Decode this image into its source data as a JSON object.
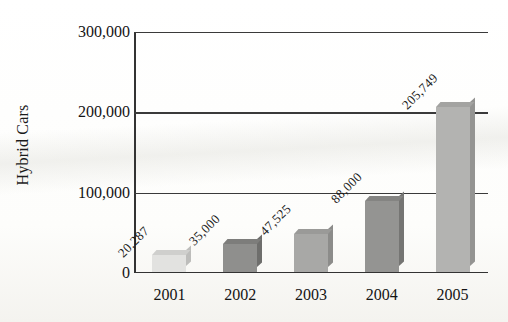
{
  "chart_data": {
    "type": "bar",
    "title": "",
    "xlabel": "",
    "ylabel": "Hybrid Cars",
    "categories": [
      "2001",
      "2002",
      "2003",
      "2004",
      "2005"
    ],
    "values": [
      20287,
      35000,
      47525,
      88000,
      205749
    ],
    "value_labels": [
      "20,287",
      "35,000",
      "47,525",
      "88,000",
      "205,749"
    ],
    "ylim": [
      0,
      300000
    ],
    "ytick_values": [
      0,
      100000,
      200000,
      300000
    ],
    "ytick_labels": [
      "0",
      "100,000",
      "200,000",
      "300,000"
    ],
    "grid": true,
    "grid_axis": "y",
    "legend": false,
    "bar_colors": [
      "#e2e2e0",
      "#8f8f8d",
      "#a8a8a6",
      "#949492",
      "#b3b3b1"
    ],
    "bar_top_colors": [
      "#cfcfcd",
      "#7d7d7b",
      "#9a9a98",
      "#848482",
      "#a3a3a1"
    ],
    "bar_side_colors": [
      "#bdbdbb",
      "#6e6e6c",
      "#8c8c8a",
      "#757573",
      "#949492"
    ],
    "axis_color": "#333333",
    "grid_color": "#3a3a3a",
    "background": "#fdfdfb",
    "value_label_rotation": -45
  }
}
